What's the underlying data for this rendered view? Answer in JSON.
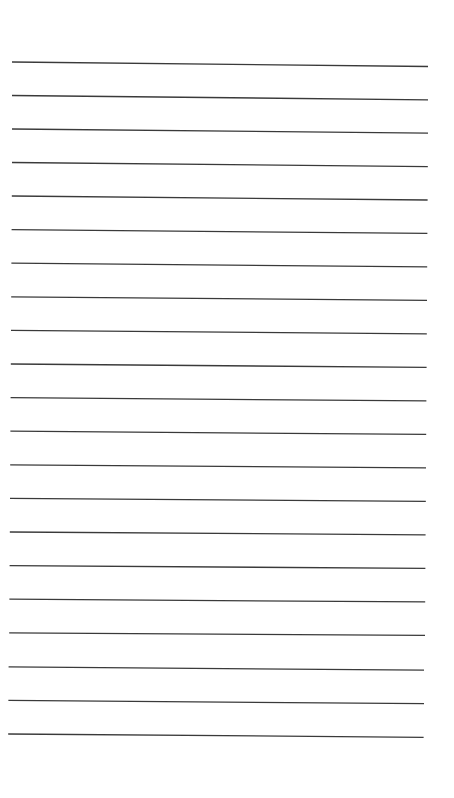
{
  "page": {
    "type": "lined-paper",
    "background": "#ffffff",
    "line_color": "#3a3a3a",
    "line_width": 1.3,
    "line_count": 21,
    "lines": [
      {
        "x1": 12,
        "y1": 62.0,
        "x2": 428,
        "y2": 66.5
      },
      {
        "x1": 12,
        "y1": 95.5,
        "x2": 428,
        "y2": 99.8
      },
      {
        "x1": 12,
        "y1": 129.0,
        "x2": 428,
        "y2": 133.2
      },
      {
        "x1": 12,
        "y1": 162.5,
        "x2": 427.8,
        "y2": 166.6
      },
      {
        "x1": 11.8,
        "y1": 196.0,
        "x2": 427.6,
        "y2": 200.0
      },
      {
        "x1": 11.6,
        "y1": 229.6,
        "x2": 427.4,
        "y2": 233.4
      },
      {
        "x1": 11.4,
        "y1": 263.2,
        "x2": 427.2,
        "y2": 266.9
      },
      {
        "x1": 11.2,
        "y1": 296.8,
        "x2": 427.0,
        "y2": 300.4
      },
      {
        "x1": 11.0,
        "y1": 330.4,
        "x2": 426.8,
        "y2": 333.9
      },
      {
        "x1": 10.8,
        "y1": 364.0,
        "x2": 426.6,
        "y2": 367.4
      },
      {
        "x1": 10.6,
        "y1": 397.6,
        "x2": 426.4,
        "y2": 400.9
      },
      {
        "x1": 10.4,
        "y1": 431.2,
        "x2": 426.2,
        "y2": 434.4
      },
      {
        "x1": 10.2,
        "y1": 464.8,
        "x2": 426.0,
        "y2": 467.9
      },
      {
        "x1": 10.0,
        "y1": 498.4,
        "x2": 425.8,
        "y2": 501.4
      },
      {
        "x1": 9.8,
        "y1": 532.0,
        "x2": 425.6,
        "y2": 534.9
      },
      {
        "x1": 9.6,
        "y1": 565.6,
        "x2": 425.4,
        "y2": 568.4
      },
      {
        "x1": 9.4,
        "y1": 599.2,
        "x2": 425.2,
        "y2": 601.9
      },
      {
        "x1": 9.2,
        "y1": 632.8,
        "x2": 425.0,
        "y2": 635.4
      },
      {
        "x1": 8.6,
        "y1": 666.8,
        "x2": 424.0,
        "y2": 670.2
      },
      {
        "x1": 8.4,
        "y1": 700.4,
        "x2": 424.0,
        "y2": 703.7
      },
      {
        "x1": 8.2,
        "y1": 734.0,
        "x2": 423.6,
        "y2": 737.3
      }
    ]
  }
}
